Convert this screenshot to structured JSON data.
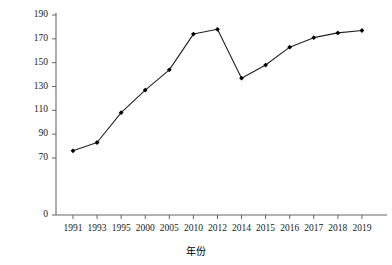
{
  "chart_data": {
    "type": "line",
    "title": "",
    "xlabel": "年份",
    "ylabel": "使用量/万吨",
    "categories": [
      "1991",
      "1993",
      "1995",
      "2000",
      "2005",
      "2010",
      "2012",
      "2014",
      "2015",
      "2016",
      "2017",
      "2018",
      "2019"
    ],
    "values": [
      76,
      83,
      108,
      127,
      144,
      174,
      178,
      137,
      148,
      163,
      171,
      175,
      177
    ],
    "series": [
      {
        "name": "使用量",
        "values": [
          76,
          83,
          108,
          127,
          144,
          174,
          178,
          137,
          148,
          163,
          171,
          175,
          177
        ]
      }
    ],
    "ylim": [
      0,
      190
    ],
    "y_ticks": [
      0,
      70,
      90,
      110,
      130,
      150,
      170,
      190
    ],
    "y_tick_labels": [
      "0",
      "70",
      "90",
      "110",
      "130",
      "150",
      "170",
      "190"
    ],
    "x_tick_labels": [
      "1991",
      "1993",
      "1995",
      "2000",
      "2005",
      "2010",
      "2012",
      "2014",
      "2015",
      "2016",
      "2017",
      "2018",
      "2019"
    ],
    "grid": false,
    "legend": false,
    "legend_position": "none",
    "line_color": "#222222",
    "marker_color": "#000000",
    "marker": "diamond",
    "axis_color": "#555555"
  },
  "axis_titles": {
    "y": "使用量/万吨",
    "x": "年份"
  }
}
